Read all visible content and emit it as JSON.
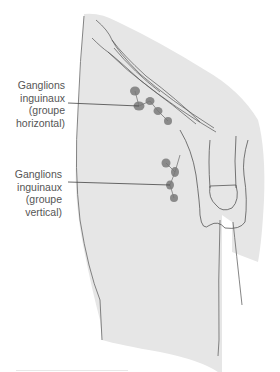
{
  "figure": {
    "colors": {
      "body_fill": "#e6e6e6",
      "outline": "#555555",
      "node": "#8a8a8a",
      "label_text": "#555555",
      "background": "#ffffff"
    },
    "labels": [
      {
        "id": "horizontal-group",
        "lines": [
          "Ganglions",
          "inguinaux",
          "(groupe",
          "horizontal)"
        ]
      },
      {
        "id": "vertical-group",
        "lines": [
          "Ganglions",
          "inguinaux",
          "(groupe",
          "vertical)"
        ]
      }
    ]
  }
}
